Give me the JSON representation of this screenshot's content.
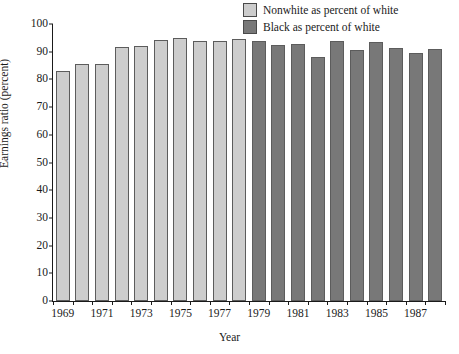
{
  "chart_data": {
    "type": "bar",
    "title": "",
    "xlabel": "Year",
    "ylabel": "Earnings ratio (percent)",
    "ylim": [
      0,
      100
    ],
    "ytick_values": [
      0,
      10,
      20,
      30,
      40,
      50,
      60,
      70,
      80,
      90,
      100
    ],
    "ytick_labels": [
      "0",
      "10",
      "20",
      "30",
      "40",
      "50",
      "60",
      "70",
      "80",
      "90",
      "100"
    ],
    "grid": false,
    "legend_position": "top-right",
    "categories": [
      1969,
      1970,
      1971,
      1972,
      1973,
      1974,
      1975,
      1976,
      1977,
      1978,
      1979,
      1980,
      1981,
      1982,
      1983,
      1984,
      1985,
      1986,
      1987,
      1988
    ],
    "xtick_labels": [
      "1969",
      "1971",
      "1973",
      "1975",
      "1977",
      "1979",
      "1981",
      "1983",
      "1985",
      "1987"
    ],
    "xtick_label_years": [
      1969,
      1971,
      1973,
      1975,
      1977,
      1979,
      1981,
      1983,
      1985,
      1987
    ],
    "series": [
      {
        "name": "Nonwhite as percent of white",
        "color": "#cdcdcd",
        "x": [
          1969,
          1970,
          1971,
          1972,
          1973,
          1974,
          1975,
          1976,
          1977,
          1978
        ],
        "values": [
          83.2,
          85.6,
          85.6,
          91.7,
          92.1,
          94.2,
          94.9,
          93.8,
          93.7,
          94.5
        ]
      },
      {
        "name": "Black as percent of white",
        "color": "#787878",
        "x": [
          1979,
          1980,
          1981,
          1982,
          1983,
          1984,
          1985,
          1986,
          1987,
          1988
        ],
        "values": [
          93.9,
          92.3,
          92.8,
          88.0,
          94.0,
          90.5,
          93.5,
          91.3,
          89.5,
          90.8
        ]
      }
    ]
  },
  "legend": {
    "items": [
      {
        "label": "Nonwhite as percent of white",
        "color": "#cdcdcd"
      },
      {
        "label": "Black as percent of white",
        "color": "#787878"
      }
    ]
  },
  "axes": {
    "y_title": "Earnings ratio (percent)",
    "x_title": "Year"
  }
}
